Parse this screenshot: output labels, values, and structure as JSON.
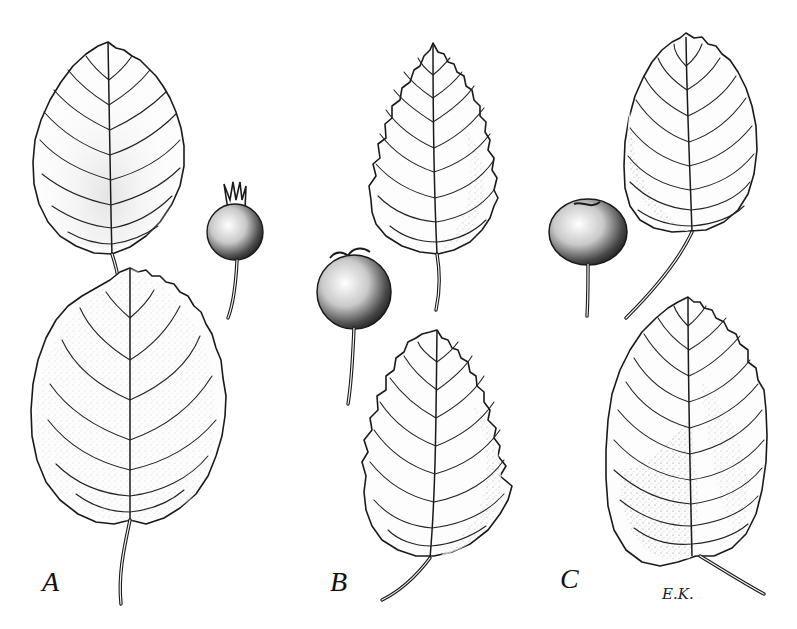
{
  "figure": {
    "type": "botanical-illustration",
    "style": "black-and-white pen and stipple drawing",
    "background_color": "#ffffff",
    "ink_color": "#1a1a1a",
    "panels": [
      {
        "label": "A",
        "contents": [
          "upper leaf, ovate, finely serrate",
          "lower leaf, broad-ovate, serrate, long petiole",
          "small round fruit with persistent calyx lobes on stalk"
        ]
      },
      {
        "label": "B",
        "contents": [
          "upper leaf, ovate, coarsely serrate",
          "lower leaf, ovate, coarsely serrate",
          "round fruit with calyx on long stalk"
        ]
      },
      {
        "label": "C",
        "contents": [
          "upper leaf, elliptic, crenate at tip, long petiole",
          "lower leaf, broad-elliptic, serrate towards tip",
          "round fruit, depressed top, on stalk"
        ]
      }
    ],
    "signature": "E.K."
  }
}
